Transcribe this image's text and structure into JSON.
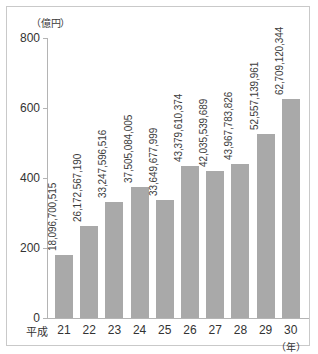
{
  "chart_data": {
    "type": "bar",
    "title": "",
    "subtitle": "",
    "unit_label": "（億円）",
    "xlabel": "（年）",
    "ylabel": "",
    "era_prefix": "平成",
    "grid": false,
    "legend": null,
    "ylim": [
      0,
      800
    ],
    "yticks": [
      0,
      200,
      400,
      600,
      800
    ],
    "ytick_labels": [
      "0",
      "200",
      "400",
      "600",
      "800"
    ],
    "categories": [
      "21",
      "22",
      "23",
      "24",
      "25",
      "26",
      "27",
      "28",
      "29",
      "30"
    ],
    "values": [
      180.97,
      261.73,
      332.48,
      375.05,
      336.5,
      433.8,
      420.36,
      439.68,
      525.57,
      627.09
    ],
    "data_labels": [
      "18,096,700,515",
      "26,172,567,190",
      "33,247,596,516",
      "37,505,084,005",
      "33,649,677,999",
      "43,379,610,374",
      "42,035,539,689",
      "43,967,783,826",
      "52,557,139,961",
      "62,709,120,344"
    ],
    "bar_color": "#a9a9a9",
    "axis_color": "#b4b4b4",
    "text_color": "#333333",
    "frame_color": "#c9c9c9",
    "background": "#ffffff"
  }
}
